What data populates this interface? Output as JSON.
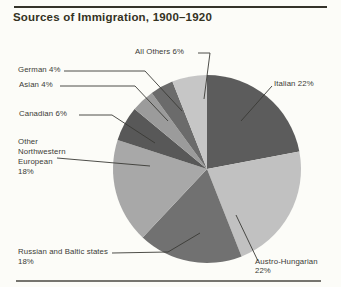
{
  "title": "Sources of Immigration, 1900–1920",
  "colors": {
    "background": "#fcfcf8",
    "leader_line": "#3a3a35",
    "top_rule": "#35332a",
    "bottom_rule": "#76756f",
    "label_text": "#3b3b36",
    "title_text": "#34321f"
  },
  "labels": {
    "all_others": "All Others 6%",
    "italian": "Italian 22%",
    "german": "German 4%",
    "asian": "Asian 4%",
    "canadian": "Canadian 6%",
    "other_nw": "Other\nNorthwestern\nEuropean\n18%",
    "russian": "Russian and Baltic states\n18%",
    "austro": "Austro-Hungarian\n22%"
  },
  "chart_data": {
    "type": "pie",
    "title": "Sources of Immigration, 1900–1920",
    "start_angle_deg": 0,
    "direction": "clockwise",
    "legend_position": "callout-labels",
    "slices": [
      {
        "label": "Italian",
        "value_pct": 22,
        "color": "#5c5c5c"
      },
      {
        "label": "Austro-Hungarian",
        "value_pct": 22,
        "color": "#c1c1c1"
      },
      {
        "label": "Russian and Baltic states",
        "value_pct": 18,
        "color": "#717171"
      },
      {
        "label": "Other Northwestern European",
        "value_pct": 18,
        "color": "#a8a8a8"
      },
      {
        "label": "Canadian",
        "value_pct": 6,
        "color": "#585858"
      },
      {
        "label": "Asian",
        "value_pct": 4,
        "color": "#9b9b9b"
      },
      {
        "label": "German",
        "value_pct": 4,
        "color": "#6b6b6b"
      },
      {
        "label": "All Others",
        "value_pct": 6,
        "color": "#c6c6c6"
      }
    ]
  }
}
